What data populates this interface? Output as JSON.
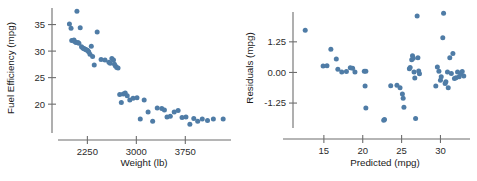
{
  "figure": {
    "background": "#ffffff",
    "point_color": "#4f7ca6",
    "axis_color": "#6d6d6d",
    "text_color": "#1a1a1a"
  },
  "chart_data": [
    {
      "type": "scatter",
      "title": "",
      "xlabel": "Weight (lb)",
      "ylabel": "Fuel Efficiency (mpg)",
      "xlim": [
        1800,
        4450
      ],
      "ylim": [
        14.0,
        38.5
      ],
      "grid": false,
      "legend": null,
      "xticks": [
        2250,
        3000,
        3750
      ],
      "xticklabels": [
        "2250",
        "3000",
        "3750"
      ],
      "yticks": [
        20,
        25,
        30,
        35
      ],
      "yticklabels": [
        "20",
        "25",
        "30",
        "35"
      ],
      "marker": "circle",
      "marker_color": "#4f7ca6",
      "x": [
        1975,
        2000,
        2010,
        2045,
        2055,
        2075,
        2090,
        2105,
        2120,
        2140,
        2160,
        2180,
        2195,
        2210,
        2225,
        2240,
        2255,
        2270,
        2290,
        2310,
        2330,
        2355,
        2400,
        2460,
        2520,
        2580,
        2600,
        2625,
        2650,
        2665,
        2680,
        2700,
        2720,
        2745,
        2770,
        2800,
        2830,
        2860,
        2900,
        2950,
        3010,
        3060,
        3120,
        3180,
        3250,
        3320,
        3390,
        3430,
        3470,
        3520,
        3580,
        3640,
        3700,
        3760,
        3820,
        3880,
        3940,
        4010,
        4090,
        4180,
        4330
      ],
      "y": [
        35.1,
        34.3,
        32.0,
        32.1,
        31.8,
        31.6,
        37.5,
        31.6,
        31.5,
        34.4,
        30.8,
        30.6,
        30.5,
        30.4,
        30.3,
        30.2,
        30.1,
        29.9,
        29.4,
        30.9,
        29.0,
        27.4,
        33.6,
        28.4,
        28.3,
        27.9,
        27.7,
        28.6,
        28.3,
        27.5,
        27.2,
        26.9,
        26.8,
        21.8,
        20.3,
        21.9,
        22.1,
        21.6,
        20.8,
        21.1,
        21.2,
        17.2,
        20.8,
        18.5,
        16.8,
        19.3,
        19.2,
        18.9,
        17.6,
        17.7,
        18.5,
        18.8,
        17.5,
        17.6,
        16.2,
        17.3,
        16.8,
        17.2,
        16.9,
        17.2,
        17.2
      ]
    },
    {
      "type": "scatter",
      "title": "",
      "xlabel": "Predicted (mpg)",
      "ylabel": "Residuals (mpg)",
      "xlim": [
        11.8,
        33.8
      ],
      "ylim": [
        -2.35,
        2.55
      ],
      "grid": false,
      "legend": null,
      "xticks": [
        15,
        20,
        25,
        30
      ],
      "xticklabels": [
        "15",
        "20",
        "25",
        "30"
      ],
      "yticks": [
        -1.25,
        0.0,
        1.25
      ],
      "yticklabels": [
        "-1.25",
        "0.00",
        "1.25"
      ],
      "marker": "circle",
      "marker_color": "#4f7ca6",
      "x": [
        12.6,
        14.9,
        15.4,
        15.9,
        16.6,
        16.8,
        17.3,
        17.9,
        18.4,
        18.7,
        19.0,
        20.2,
        20.3,
        20.4,
        20.4,
        22.7,
        22.8,
        23.6,
        24.4,
        24.8,
        25.1,
        25.2,
        25.3,
        26.0,
        26.1,
        26.3,
        26.4,
        26.5,
        26.6,
        26.7,
        26.8,
        27.0,
        27.1,
        27.2,
        27.3,
        29.4,
        29.6,
        29.8,
        30.0,
        30.1,
        30.3,
        30.4,
        30.6,
        30.7,
        30.9,
        31.0,
        31.2,
        31.4,
        31.6,
        31.8,
        32.0,
        32.2,
        32.4,
        32.6,
        32.8,
        33.0
      ],
      "y": [
        1.72,
        0.26,
        0.27,
        0.95,
        0.55,
        0.13,
        0.02,
        0.04,
        0.19,
        0.17,
        0.02,
        0.05,
        -0.55,
        -1.45,
        0.05,
        -1.95,
        -1.92,
        -0.54,
        -0.52,
        -0.62,
        -0.88,
        -1.05,
        -1.42,
        0.15,
        0.2,
        0.52,
        0.68,
        0.58,
        0.02,
        -0.23,
        -1.88,
        2.3,
        0.6,
        0.06,
        -0.05,
        -0.55,
        0.22,
        0.05,
        -0.32,
        -0.18,
        1.42,
        2.42,
        -0.45,
        -0.38,
        0.02,
        -0.62,
        0.6,
        -0.04,
        0.77,
        -0.25,
        -0.22,
        0.02,
        -0.18,
        -0.06,
        0.04,
        -0.14
      ]
    }
  ]
}
